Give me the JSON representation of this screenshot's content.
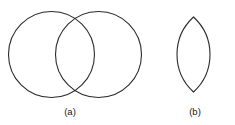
{
  "figure": {
    "background_color": "#ffffff",
    "stroke_color": "#2b2b2b",
    "stroke_width": 1.1,
    "panels": [
      {
        "id": "panel-a",
        "caption": "(a)",
        "shape_name": "two-overlapping-circles",
        "description": "Two congruent circles overlapping in a vesica region",
        "circles": [
          {
            "name": "left-circle",
            "cx": 51.5,
            "cy": 54.5,
            "r": 43.0
          },
          {
            "name": "right-circle",
            "cx": 98.5,
            "cy": 54.5,
            "r": 43.0
          }
        ]
      },
      {
        "id": "panel-b",
        "caption": "(b)",
        "shape_name": "lens-vesica-piscis",
        "description": "The lens shaped intersection region of the two circles",
        "lens": {
          "name": "lens-shape",
          "top_x": 193.5,
          "top_y": 17.0,
          "bottom_x": 193.5,
          "bottom_y": 92.0,
          "left_x": 177.0,
          "right_x": 210.0,
          "mid_y": 54.5
        }
      }
    ]
  }
}
